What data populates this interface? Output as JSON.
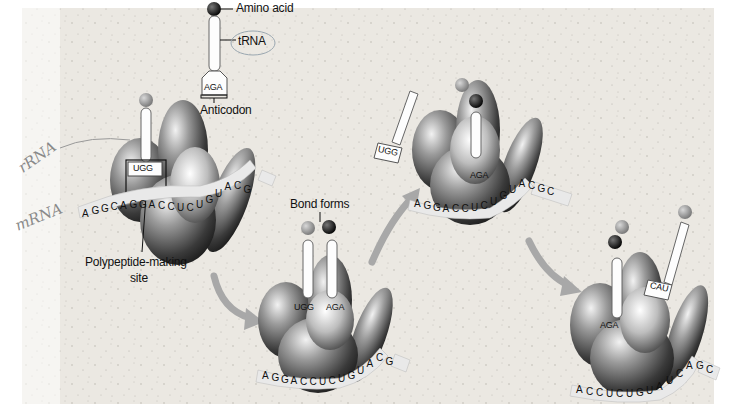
{
  "diagram": {
    "type": "translation-process",
    "colors": {
      "background": "#ece9e3",
      "ribosome_dark": "#3a3a3a",
      "ribosome_light": "#d8d8d8",
      "amino_acid_black": "#111111",
      "amino_acid_gray": "#9a9a9a",
      "arrow": "#a8a8a8",
      "handwriting": "#8a8a8a"
    },
    "labels": {
      "amino_acid": "Amino acid",
      "trna": "tRNA",
      "anticodon": "Anticodon",
      "bond_forms": "Bond forms",
      "polypeptide_site_line1": "Polypeptide-making",
      "polypeptide_site_line2": "site"
    },
    "handwritten": {
      "rrna": "rRNA",
      "mrna": "mRNA"
    },
    "legend_trna": {
      "anticodon": "AGA"
    },
    "stages": [
      {
        "id": "stage-1",
        "mrna": [
          "A",
          "G",
          "G",
          "C",
          "A",
          "G",
          "G",
          "A",
          "C",
          "C",
          "U",
          "C",
          "U",
          "G",
          "U",
          "A",
          "C",
          "G"
        ],
        "trnas": [
          {
            "anticodon": "UGG",
            "amino_acid": "gray"
          }
        ],
        "highlighted_box": "UGG / ACC"
      },
      {
        "id": "stage-2",
        "mrna": [
          "A",
          "G",
          "G",
          "A",
          "C",
          "C",
          "U",
          "C",
          "U",
          "G",
          "U",
          "A",
          "C",
          "G"
        ],
        "trnas": [
          {
            "anticodon": "UGG",
            "amino_acid": "gray"
          },
          {
            "anticodon": "AGA",
            "amino_acid": "black"
          }
        ]
      },
      {
        "id": "stage-3",
        "mrna": [
          "A",
          "G",
          "G",
          "A",
          "C",
          "C",
          "U",
          "C",
          "U",
          "G",
          "U",
          "A",
          "C",
          "G",
          "C"
        ],
        "trnas": [
          {
            "anticodon": "UGG",
            "amino_acid": "none",
            "state": "released"
          },
          {
            "anticodon": "AGA",
            "amino_acid": "gray+black"
          }
        ]
      },
      {
        "id": "stage-4",
        "mrna": [
          "A",
          "C",
          "C",
          "U",
          "C",
          "U",
          "G",
          "U",
          "A",
          "U",
          "C",
          "A",
          "G",
          "C"
        ],
        "trnas": [
          {
            "anticodon": "AGA",
            "amino_acid": "gray+black"
          },
          {
            "anticodon": "CAU",
            "amino_acid": "gray",
            "state": "incoming"
          }
        ]
      }
    ]
  }
}
